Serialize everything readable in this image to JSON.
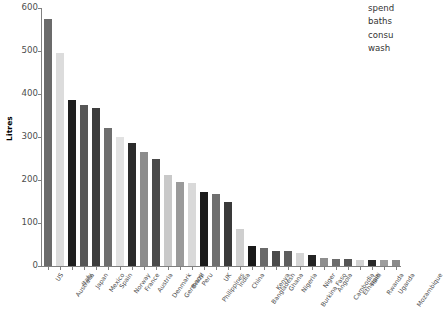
{
  "chart_data": {
    "type": "bar",
    "title": "",
    "xlabel": "",
    "ylabel": "Litres",
    "ylim": [
      0,
      600
    ],
    "yticks": [
      0,
      100,
      200,
      300,
      400,
      500,
      600
    ],
    "grid": false,
    "legend_position": "top-right",
    "categories": [
      "US",
      "Australia",
      "Italy",
      "Japan",
      "Mexico",
      "Spain",
      "Norway",
      "France",
      "Austria",
      "Denmark",
      "Germany",
      "Brazil",
      "Peru",
      "Philippines",
      "UK",
      "India",
      "China",
      "Bangladesh",
      "Kenya",
      "Ghana",
      "Nigeria",
      "Burkina Faso",
      "Niger",
      "Angola",
      "Cambodia",
      "Ethiopia",
      "Haiti",
      "Rwanda",
      "Uganda",
      "Mozambique"
    ],
    "values": [
      575,
      495,
      386,
      375,
      367,
      320,
      300,
      287,
      266,
      250,
      212,
      196,
      193,
      172,
      168,
      149,
      86,
      46,
      42,
      36,
      34,
      30,
      25,
      19,
      17,
      16,
      15,
      15,
      15,
      15
    ],
    "bar_colors": [
      "#6b6b6b",
      "#dcdcdc",
      "#1f1f1f",
      "#575757",
      "#3d3d3d",
      "#6e6e6e",
      "#e2e2e2",
      "#2b2b2b",
      "#8c8c8c",
      "#4a4a4a",
      "#c9c9c9",
      "#9a9a9a",
      "#d9d9d9",
      "#1c1c1c",
      "#6f6f6f",
      "#3a3a3a",
      "#cfcfcf",
      "#1a1a1a",
      "#6a6a6a",
      "#4a4a4a",
      "#5e5e5e",
      "#d5d5d5",
      "#242424",
      "#8e8e8e",
      "#6b6b6b",
      "#555555",
      "#d2d2d2",
      "#2a2a2a",
      "#9d9d9d",
      "#8a8a8a"
    ],
    "legend_labels": [
      "spend",
      "baths",
      "consu",
      "wash"
    ]
  },
  "axis": {
    "y_title": "Litres"
  }
}
